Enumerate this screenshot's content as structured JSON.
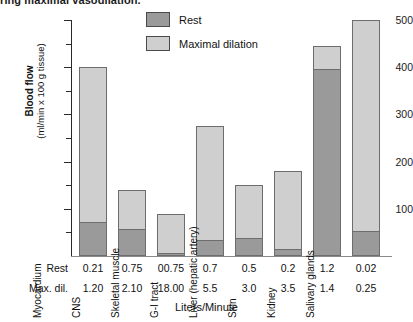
{
  "figure": {
    "title_partial": "ring maximal vasodilation.",
    "x_caption": "Liters/Minute",
    "y_caption_line1": "Blood flow",
    "y_caption_line2": "(ml/min x 100 g tissue)"
  },
  "legend": {
    "position": "top-center",
    "items": [
      {
        "label": "Rest",
        "color": "#9a9a9a"
      },
      {
        "label": "Maximal dilation",
        "color": "#cfcfcf"
      }
    ]
  },
  "table": {
    "row_labels": [
      "Rest",
      "Max. dil."
    ],
    "rest_values": [
      "0.21",
      "0.75",
      "00.75",
      "0.7",
      "0.5",
      "0.2",
      "1.2",
      "0.02"
    ],
    "maxdil_values": [
      "1.20",
      "2.10",
      "18.00",
      "5.5",
      "3.0",
      "3.5",
      "1.4",
      "0.25"
    ]
  },
  "chart_data": {
    "type": "bar",
    "subtype": "stacked",
    "title": "ring maximal vasodilation.",
    "xlabel": "Liters/Minute",
    "ylabel": "Blood flow (ml/min x 100 g tissue)",
    "ylim": [
      0,
      500
    ],
    "yticks": [
      100,
      200,
      300,
      400,
      500
    ],
    "yticks_minor": [
      50,
      150,
      250,
      350,
      450
    ],
    "grid": false,
    "legend_position": "top-center",
    "categories": [
      "Myocardium",
      "CNS",
      "Skeletal muscle",
      "G-I tract",
      "Liver (hepatic artery)",
      "Skin",
      "Kidney",
      "Salivary glands"
    ],
    "series": [
      {
        "name": "Rest",
        "color": "#9a9a9a",
        "values": [
          70,
          55,
          4,
          32,
          36,
          12,
          395,
          50
        ]
      },
      {
        "name": "Maximal dilation",
        "color": "#cfcfcf",
        "values": [
          400,
          140,
          90,
          275,
          150,
          180,
          445,
          500
        ]
      }
    ],
    "note": "Maximal dilation values are the total bar heights; the Rest segment is drawn inside the bottom of each bar.",
    "flow_table": {
      "units": "Liters/Minute",
      "rows": [
        {
          "name": "Rest",
          "values": [
            0.21,
            0.75,
            0.75,
            0.7,
            0.5,
            0.2,
            1.2,
            0.02
          ]
        },
        {
          "name": "Max. dil.",
          "values": [
            1.2,
            2.1,
            18.0,
            5.5,
            3.0,
            3.5,
            1.4,
            0.25
          ]
        }
      ]
    }
  }
}
